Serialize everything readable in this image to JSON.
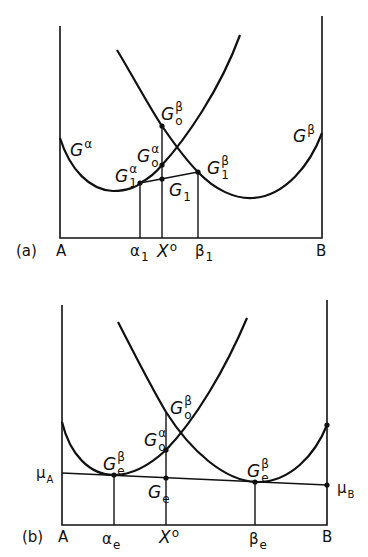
{
  "panel_a": {
    "label": "(a)",
    "x_left": "A",
    "x_right": "B",
    "curves": {
      "alpha": {
        "base": "G",
        "sup": "α"
      },
      "beta": {
        "base": "G",
        "sup": "β"
      }
    },
    "points": {
      "G0_beta": {
        "base": "G",
        "sup": "β",
        "sub": "o"
      },
      "G0_alpha": {
        "base": "G",
        "sup": "α",
        "sub": "o"
      },
      "G1_alpha": {
        "base": "G",
        "sup": "α",
        "sub": "1"
      },
      "G1_beta": {
        "base": "G",
        "sup": "β",
        "sub": "1"
      },
      "G1": {
        "base": "G",
        "sub": "1"
      }
    },
    "ticks": {
      "alpha1": {
        "base": "α",
        "sub": "1"
      },
      "x0": {
        "base": "X",
        "sup": "o"
      },
      "beta1": {
        "base": "β",
        "sub": "1"
      }
    }
  },
  "panel_b": {
    "label": "(b)",
    "x_left": "A",
    "x_right": "B",
    "mu_A": {
      "base": "μ",
      "sub": "A"
    },
    "mu_B": {
      "base": "μ",
      "sub": "B"
    },
    "points": {
      "G0_beta": {
        "base": "G",
        "sup": "β",
        "sub": "o"
      },
      "G0_alpha": {
        "base": "G",
        "sup": "α",
        "sub": "o"
      },
      "Ge_left": {
        "base": "G",
        "sup": "β",
        "sub": "e"
      },
      "Ge_right": {
        "base": "G",
        "sup": "β",
        "sub": "e"
      },
      "Ge": {
        "base": "G",
        "sub": "e"
      }
    },
    "ticks": {
      "alpha_e": {
        "base": "α",
        "sub": "e"
      },
      "x0": {
        "base": "X",
        "sup": "o"
      },
      "beta_e": {
        "base": "β",
        "sub": "e"
      }
    }
  }
}
